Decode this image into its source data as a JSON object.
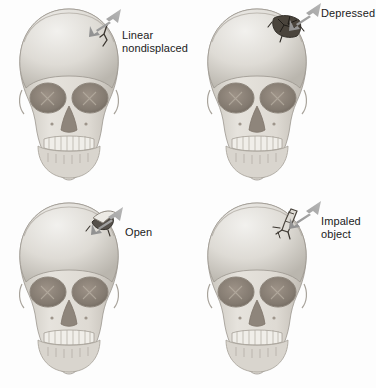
{
  "figure": {
    "background_color": "#fdfdfd",
    "label_color": "#1b1b1b",
    "arrow_color": "#9a9a9a",
    "bone_light": "#e6e4e0",
    "bone_mid": "#c9c6c0",
    "bone_shadow": "#a9a59e",
    "orbit_color": "#8a8077",
    "fracture_color": "#3a352f"
  },
  "panels": [
    {
      "id": "linear-nondisplaced",
      "position": "top-left",
      "label": "Linear\nnondisplaced",
      "arrow": "down-left-arrow-icon",
      "injury": "linear-fracture"
    },
    {
      "id": "depressed",
      "position": "top-right",
      "label": "Depressed",
      "arrow": "down-left-arrow-icon",
      "injury": "depressed-fracture"
    },
    {
      "id": "open",
      "position": "bottom-left",
      "label": "Open",
      "arrow": "down-left-arrow-icon",
      "injury": "open-fracture"
    },
    {
      "id": "impaled-object",
      "position": "bottom-right",
      "label": "Impaled\nobject",
      "arrow": "down-left-arrow-icon",
      "injury": "impaled-object"
    }
  ]
}
